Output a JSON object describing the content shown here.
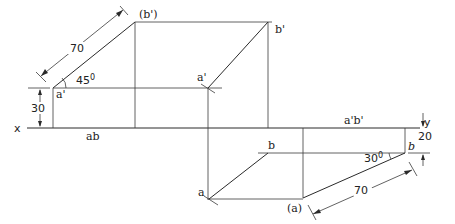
{
  "diagram": {
    "reference_line": {
      "x_label": "x",
      "y_label": "y"
    },
    "labels": {
      "b_prime_initial": "(b')",
      "a_prime_left": "a'",
      "ab_plan_on_xy": "ab",
      "a_prime_final": "a'",
      "b_prime_final": "b'",
      "a_prime_b_prime_on_xy": "a'b'",
      "b_plan": "b",
      "b_plan_right": "b",
      "a_plan": "a",
      "a_plan_initial": "(a)"
    },
    "dimensions": {
      "true_length_front": "70",
      "angle_front": "45",
      "angle_front_unit": "0",
      "height_a": "30",
      "true_length_top": "70",
      "angle_top": "30",
      "angle_top_unit": "0",
      "distance_b": "20"
    },
    "colors": {
      "line": "#2a2a2a",
      "background": "#ffffff"
    }
  }
}
